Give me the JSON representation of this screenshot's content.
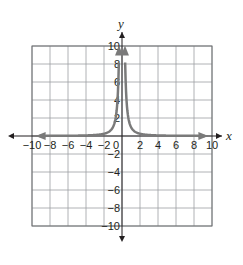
{
  "chart_data": {
    "type": "line",
    "title": "",
    "xlabel": "x",
    "ylabel": "y",
    "xlim": [
      -10,
      10
    ],
    "ylim": [
      -10,
      10
    ],
    "grid": true,
    "grid_step": 2,
    "x_ticks": [
      "−10",
      "−8",
      "−6",
      "−4",
      "−2",
      "0",
      "2",
      "4",
      "6",
      "8",
      "10"
    ],
    "y_ticks": [
      "10",
      "8",
      "6",
      "4",
      "2",
      "−2",
      "−4",
      "−6",
      "−8",
      "−10"
    ],
    "series": [
      {
        "name": "curve",
        "description": "symmetric curve approaching y-axis asymptote upward and x-axis asymptote outward, approx y = 1/x^2",
        "color": "#7a7a7a",
        "x": [
          -10,
          -8,
          -6,
          -4,
          -3,
          -2,
          -1.5,
          -1,
          -0.7,
          -0.5,
          -0.4,
          -0.33,
          0.33,
          0.4,
          0.5,
          0.7,
          1,
          1.5,
          2,
          3,
          4,
          6,
          8,
          10
        ],
        "y": [
          0.01,
          0.016,
          0.028,
          0.06,
          0.11,
          0.25,
          0.44,
          1,
          2.04,
          4,
          6.25,
          9.2,
          9.2,
          6.25,
          4,
          2.04,
          1,
          0.44,
          0.25,
          0.11,
          0.06,
          0.028,
          0.016,
          0.01
        ]
      }
    ],
    "colors": {
      "grid": "#9d9fa2",
      "axis": "#231f20",
      "curve": "#7a7a7a"
    }
  }
}
